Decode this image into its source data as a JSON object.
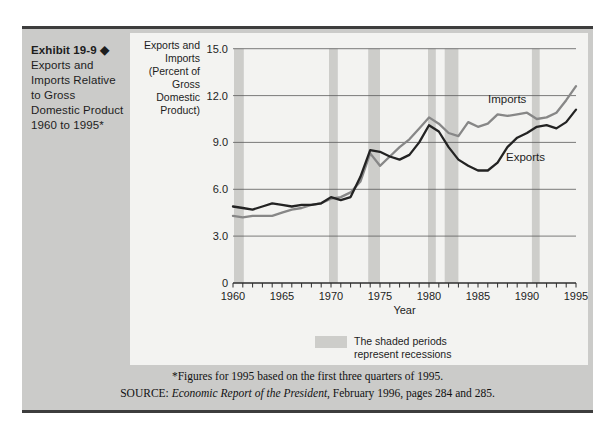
{
  "exhibit": {
    "label": "Exhibit 19-9",
    "diamond": "◆",
    "caption_lines": [
      "Exports and",
      "Imports Relative",
      "to Gross",
      "Domestic Product",
      "1960 to 1995*"
    ]
  },
  "chart_data": {
    "type": "line",
    "title": "",
    "xlabel": "Year",
    "ylabel_lines": [
      "Exports and",
      "Imports",
      "(Percent of",
      "Gross",
      "Domestic",
      "Product)"
    ],
    "ylim": [
      0,
      15
    ],
    "yticks": [
      0,
      3,
      6,
      9,
      12,
      15
    ],
    "ytick_labels": [
      "0",
      "3.0",
      "6.0",
      "9.0",
      "12.0",
      "15.0"
    ],
    "xticks": [
      1960,
      1965,
      1970,
      1975,
      1980,
      1985,
      1990,
      1995
    ],
    "x": [
      1960,
      1961,
      1962,
      1963,
      1964,
      1965,
      1966,
      1967,
      1968,
      1969,
      1970,
      1971,
      1972,
      1973,
      1974,
      1975,
      1976,
      1977,
      1978,
      1979,
      1980,
      1981,
      1982,
      1983,
      1984,
      1985,
      1986,
      1987,
      1988,
      1989,
      1990,
      1991,
      1992,
      1993,
      1994,
      1995
    ],
    "series": [
      {
        "name": "Imports",
        "color": "#878787",
        "values": [
          4.3,
          4.2,
          4.3,
          4.3,
          4.3,
          4.5,
          4.7,
          4.8,
          5.0,
          5.1,
          5.4,
          5.5,
          5.8,
          6.5,
          8.3,
          7.5,
          8.1,
          8.7,
          9.2,
          9.9,
          10.6,
          10.2,
          9.6,
          9.4,
          10.3,
          10.0,
          10.2,
          10.8,
          10.7,
          10.8,
          10.9,
          10.5,
          10.6,
          10.9,
          11.7,
          12.6
        ]
      },
      {
        "name": "Exports",
        "color": "#232323",
        "values": [
          4.9,
          4.8,
          4.7,
          4.9,
          5.1,
          5.0,
          4.9,
          5.0,
          5.0,
          5.1,
          5.5,
          5.3,
          5.5,
          6.8,
          8.5,
          8.4,
          8.1,
          7.9,
          8.2,
          9.0,
          10.1,
          9.7,
          8.7,
          7.9,
          7.5,
          7.2,
          7.2,
          7.7,
          8.7,
          9.3,
          9.6,
          10.0,
          10.1,
          9.9,
          10.3,
          11.1
        ]
      }
    ],
    "recessions": [
      [
        1960.1,
        1961.1
      ],
      [
        1969.8,
        1970.7
      ],
      [
        1973.8,
        1975.0
      ],
      [
        1979.9,
        1980.7
      ],
      [
        1981.6,
        1983.0
      ],
      [
        1990.5,
        1991.3
      ]
    ],
    "legend": {
      "lines": [
        "The shaded periods",
        "represent recessions"
      ]
    },
    "grid": true,
    "legend_position": "bottom"
  },
  "footnotes": {
    "line1": "*Figures for 1995 based on the first three quarters of 1995.",
    "source_prefix": "SOURCE: ",
    "source_italic": "Economic Report of the President",
    "source_rest": ", February 1996, pages 284 and 285."
  },
  "colors": {
    "page_bg": "#ffffff",
    "panel_bg": "#cbcbc9",
    "bar": "#3d3d3d",
    "chart_bg": "#f3f3f1",
    "grid": "#5a5a5a",
    "axis": "#2e2e2e",
    "recession": "#cdcdca",
    "text": "#1d1d1d"
  }
}
